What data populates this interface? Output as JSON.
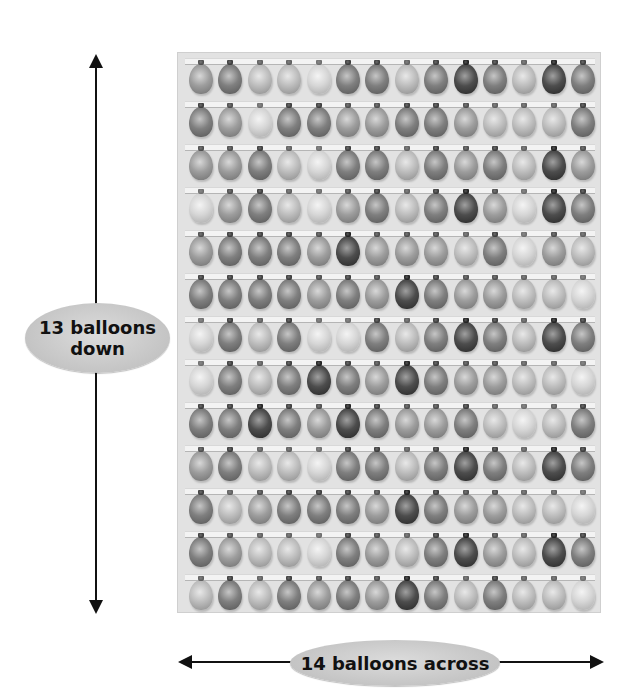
{
  "labels": {
    "vertical_line1": "13 balloons",
    "vertical_line2": "down",
    "horizontal": "14 balloons across"
  },
  "grid": {
    "rows": 13,
    "columns": 14,
    "shade_scale": [
      "very light",
      "light",
      "medium",
      "dark",
      "very dark"
    ],
    "shades": [
      [
        2,
        3,
        1,
        1,
        0,
        3,
        3,
        1,
        3,
        4,
        3,
        1,
        4,
        3
      ],
      [
        3,
        2,
        0,
        3,
        3,
        2,
        2,
        3,
        3,
        2,
        1,
        1,
        1,
        3
      ],
      [
        2,
        2,
        3,
        1,
        0,
        3,
        3,
        1,
        3,
        2,
        3,
        1,
        4,
        2
      ],
      [
        0,
        2,
        3,
        1,
        0,
        2,
        3,
        1,
        3,
        4,
        2,
        0,
        4,
        3
      ],
      [
        2,
        3,
        3,
        3,
        2,
        4,
        2,
        2,
        2,
        1,
        3,
        0,
        2,
        1
      ],
      [
        3,
        3,
        3,
        3,
        2,
        3,
        2,
        4,
        3,
        2,
        2,
        1,
        1,
        0
      ],
      [
        0,
        3,
        1,
        3,
        0,
        0,
        3,
        1,
        3,
        4,
        3,
        1,
        4,
        3
      ],
      [
        0,
        3,
        1,
        3,
        4,
        3,
        2,
        4,
        3,
        2,
        2,
        1,
        1,
        0
      ],
      [
        3,
        3,
        4,
        3,
        2,
        4,
        3,
        2,
        2,
        3,
        1,
        0,
        1,
        3
      ],
      [
        2,
        3,
        1,
        1,
        0,
        3,
        3,
        1,
        3,
        4,
        3,
        1,
        4,
        3
      ],
      [
        3,
        1,
        2,
        3,
        3,
        3,
        2,
        4,
        3,
        2,
        2,
        1,
        1,
        0
      ],
      [
        3,
        2,
        1,
        1,
        0,
        3,
        2,
        1,
        3,
        4,
        2,
        1,
        4,
        3
      ],
      [
        1,
        3,
        1,
        3,
        2,
        3,
        2,
        4,
        3,
        1,
        3,
        1,
        1,
        0
      ]
    ]
  },
  "colors": {
    "board": "#e2e2e2",
    "oval": "#c4c4c4",
    "arrow": "#111111"
  }
}
